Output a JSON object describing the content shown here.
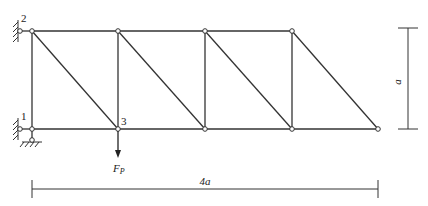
{
  "diagram": {
    "type": "truss",
    "nodes": [
      {
        "id": "2",
        "label": "2",
        "position": "top-left support"
      },
      {
        "id": "1",
        "label": "1",
        "position": "bottom-left support"
      },
      {
        "id": "3",
        "label": "3",
        "position": "bottom chord, first panel point"
      }
    ],
    "load": {
      "label": "F",
      "subscript": "P",
      "direction": "down",
      "at_node": "3"
    },
    "dimensions": {
      "horizontal": {
        "label": "4a"
      },
      "vertical": {
        "label": "a"
      }
    },
    "panels": 4,
    "colors": {
      "line": "#333333",
      "background": "#ffffff"
    }
  }
}
